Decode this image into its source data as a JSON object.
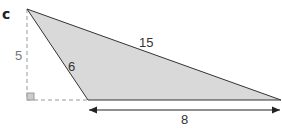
{
  "diagram": {
    "part_label": "c",
    "labels": {
      "height": "5",
      "short_side": "6",
      "long_side": "15",
      "base": "8"
    },
    "colors": {
      "fill": "#d9d9d9",
      "stroke": "#333333",
      "dashed": "#999999",
      "right_angle_fill": "#cccccc"
    },
    "shape": "obtuse triangle with external height",
    "vertices": {
      "top": [
        27,
        9
      ],
      "bottom_left": [
        88,
        100
      ],
      "bottom_right": [
        281,
        100
      ]
    }
  }
}
